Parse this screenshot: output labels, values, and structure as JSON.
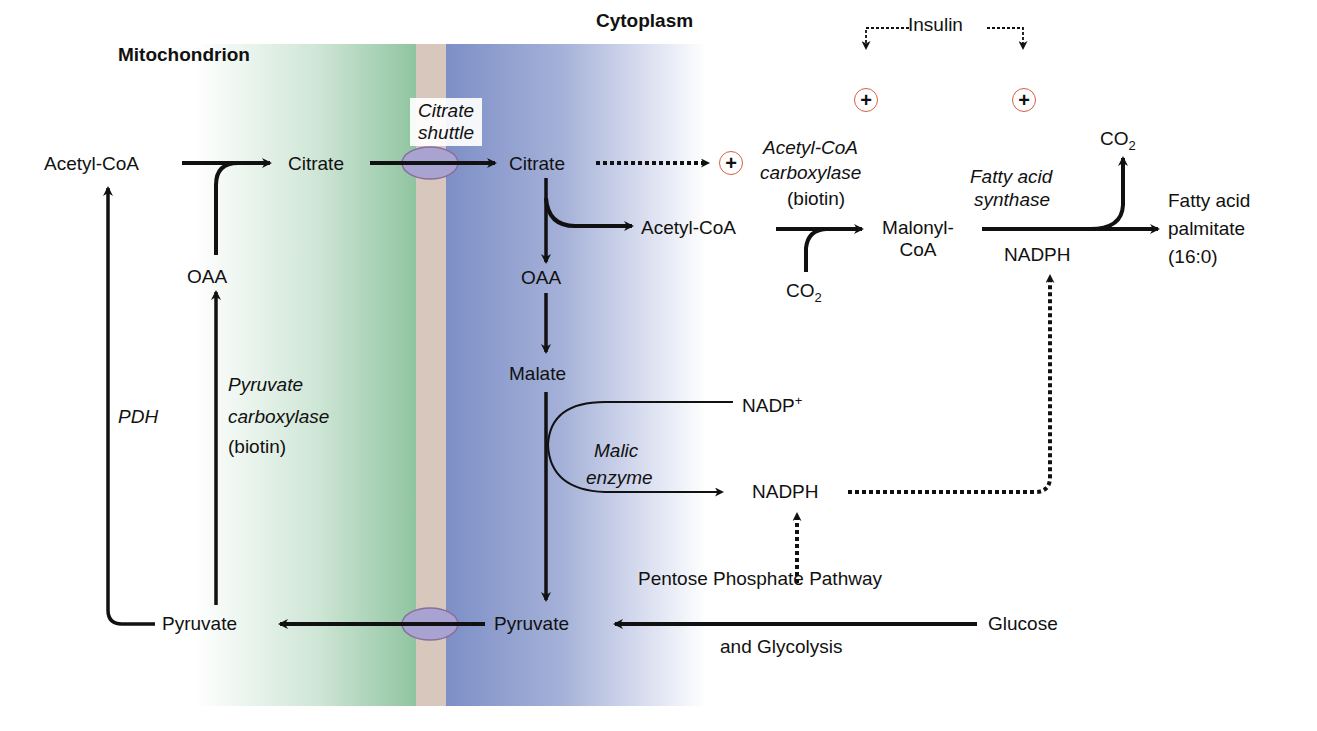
{
  "compartments": {
    "mitochondrion": "Mitochondrion",
    "cytoplasm": "Cytoplasm",
    "colors": {
      "mitochondrion": "#8fc4a0",
      "membrane": "#d7c7bc",
      "cytoplasm": "#7d8fc6",
      "transporter": "#9c97c8",
      "activation_ring": "#d9603f"
    }
  },
  "mitochondrion": {
    "acetyl_coa": "Acetyl-CoA",
    "citrate": "Citrate",
    "oaa": "OAA",
    "pyruvate": "Pyruvate",
    "pdh": "PDH",
    "pyruvate_carboxylase": "Pyruvate",
    "pyruvate_carboxylase_2": "carboxylase",
    "pyruvate_carboxylase_cofactor": "(biotin)"
  },
  "shuttle": {
    "line1": "Citrate",
    "line2": "shuttle"
  },
  "cytoplasm": {
    "citrate": "Citrate",
    "acetyl_coa": "Acetyl-CoA",
    "oaa": "OAA",
    "malate": "Malate",
    "pyruvate": "Pyruvate",
    "malic_enzyme_1": "Malic",
    "malic_enzyme_2": "enzyme",
    "nadp_plus": "NADP",
    "nadp_plus_sup": "+",
    "nadph": "NADPH",
    "glucose": "Glucose",
    "ppp_line1": "Pentose Phosphate Pathway",
    "ppp_line2": "and Glycolysis",
    "acc_1": "Acetyl-CoA",
    "acc_2": "carboxylase",
    "acc_cofactor": "(biotin)",
    "co2_a": "CO",
    "co2_a_sub": "2",
    "malonyl_1": "Malonyl-",
    "malonyl_2": "CoA",
    "fas_1": "Fatty acid",
    "fas_2": "synthase",
    "fas_nadph": "NADPH",
    "co2_b": "CO",
    "co2_b_sub": "2",
    "product_1": "Fatty acid",
    "product_2": "palmitate",
    "product_3": "(16:0)"
  },
  "regulation": {
    "insulin": "Insulin",
    "plus_symbol": "+"
  }
}
